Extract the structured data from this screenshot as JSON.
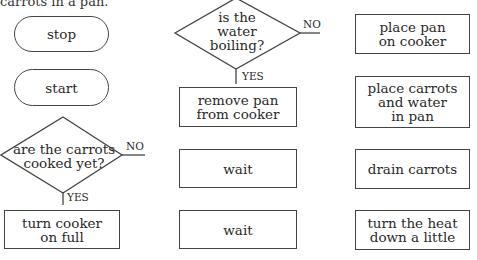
{
  "caption": "carrots in a pan.",
  "terminals": [
    {
      "id": "stop",
      "label": "stop"
    },
    {
      "id": "start",
      "label": "start"
    }
  ],
  "decisions": [
    {
      "id": "carrots-cooked",
      "label": "are the carrots\ncooked yet?",
      "no_label": "NO",
      "yes_label": "YES"
    },
    {
      "id": "water-boiling",
      "label": "is the\nwater\nboiling?",
      "no_label": "NO",
      "yes_label": "YES"
    }
  ],
  "processes": [
    {
      "id": "turn-cooker-full",
      "label": "turn cooker\non full"
    },
    {
      "id": "remove-pan",
      "label": "remove pan\nfrom cooker"
    },
    {
      "id": "wait-1",
      "label": "wait"
    },
    {
      "id": "wait-2",
      "label": "wait"
    },
    {
      "id": "place-pan",
      "label": "place pan\non cooker"
    },
    {
      "id": "place-carrots",
      "label": "place carrots\nand water\nin pan"
    },
    {
      "id": "drain-carrots",
      "label": "drain carrots"
    },
    {
      "id": "turn-heat-down",
      "label": "turn the heat\ndown a little"
    }
  ],
  "colors": {
    "stroke": "#444444",
    "text": "#2a2a2a",
    "background": "#ffffff"
  }
}
